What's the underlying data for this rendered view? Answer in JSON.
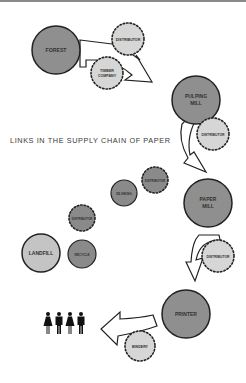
{
  "title": "LINKS IN THE SUPPLY CHAIN OF PAPER",
  "colors": {
    "major_fill": "#8f8f8f",
    "minor_fill": "#d6d6d6",
    "recycle_fill": "#8a8a8a",
    "landfill_fill": "#c4c4c4",
    "stroke": "#222222",
    "top_bar": "#8a8a8a"
  },
  "nodes": {
    "forest": {
      "label": "FOREST",
      "type": "major"
    },
    "distributor_1": {
      "label": "DISTRIBUTOR",
      "type": "intermediary"
    },
    "timber_company": {
      "label_line1": "TIMBER",
      "label_line2": "COMPANY",
      "type": "intermediary"
    },
    "pulping_mill": {
      "label_line1": "PULPING",
      "label_line2": "MILL",
      "type": "major"
    },
    "distributor_2": {
      "label": "DISTRIBUTOR",
      "type": "intermediary"
    },
    "paper_mill": {
      "label_line1": "PAPER",
      "label_line2": "MILL",
      "type": "major"
    },
    "distributor_3": {
      "label": "DISTRIBUTOR",
      "type": "intermediary"
    },
    "printer": {
      "label": "PRINTER",
      "type": "major"
    },
    "bindery": {
      "label": "BINDERY",
      "type": "intermediary"
    },
    "consumers": {
      "label": "consumers",
      "count": 4
    },
    "landfill": {
      "label": "LANDFILL",
      "type": "end"
    },
    "recycle": {
      "label": "RECYCLE",
      "type": "recycle"
    },
    "distributor_4": {
      "label": "DISTRIBUTOR",
      "type": "recycle-intermediary"
    },
    "de_inking": {
      "label": "DE-INKING",
      "type": "recycle"
    },
    "distributor_5": {
      "label": "DISTRIBUTOR",
      "type": "recycle-intermediary"
    }
  }
}
